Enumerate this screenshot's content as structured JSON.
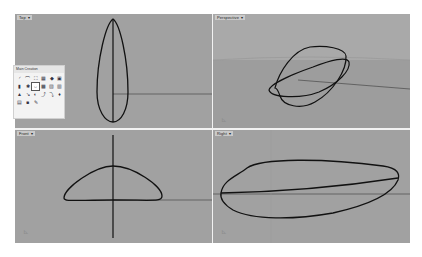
{
  "app": {
    "name": "Rhino 3D modeling workspace"
  },
  "viewports": [
    {
      "id": "top",
      "label": "Top",
      "dropdown": "▾"
    },
    {
      "id": "perspective",
      "label": "Perspective",
      "dropdown": "▾"
    },
    {
      "id": "front",
      "label": "Front",
      "dropdown": "▾"
    },
    {
      "id": "right",
      "label": "Right",
      "dropdown": "▾"
    }
  ],
  "toolbar_panel": {
    "title": "Main Creation",
    "tools": [
      {
        "icon": "arc-icon",
        "glyph": "◜"
      },
      {
        "icon": "curve-icon",
        "glyph": "⌒"
      },
      {
        "icon": "loft-icon",
        "glyph": "⛶"
      },
      {
        "icon": "surface-icon",
        "glyph": "▦"
      },
      {
        "icon": "extrude-icon",
        "glyph": "◆"
      },
      {
        "icon": "patch-icon",
        "glyph": "▣"
      },
      {
        "icon": "box-icon",
        "glyph": "▮"
      },
      {
        "icon": "gear-icon",
        "glyph": "✱"
      },
      {
        "icon": "sweep-icon",
        "glyph": "⇔"
      },
      {
        "icon": "mesh-icon",
        "glyph": "▩"
      },
      {
        "icon": "solid-icon",
        "glyph": "▧"
      },
      {
        "icon": "cylinder-icon",
        "glyph": "▥"
      },
      {
        "icon": "cone-icon",
        "glyph": "▲"
      },
      {
        "icon": "pipe-icon",
        "glyph": "↘"
      },
      {
        "icon": "revolve-icon",
        "glyph": "◐"
      },
      {
        "icon": "fillet-icon",
        "glyph": "⤴"
      },
      {
        "icon": "blend-icon",
        "glyph": "⤵"
      },
      {
        "icon": "point-icon",
        "glyph": "♦"
      },
      {
        "icon": "render-icon",
        "glyph": "▤"
      },
      {
        "icon": "material-icon",
        "glyph": "■"
      },
      {
        "icon": "pen-icon",
        "glyph": "✎"
      }
    ],
    "active_index": 8
  },
  "colors": {
    "viewport_bg": "#a1a1a1",
    "curve": "#111111",
    "axis": "#3a3a3a",
    "sky": "#a9a9a9",
    "ground": "#9d9d9d"
  }
}
